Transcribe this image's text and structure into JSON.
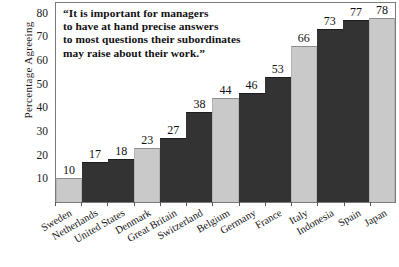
{
  "chart_data": {
    "type": "bar",
    "title": "",
    "xlabel": "",
    "ylabel": "Percentage Agreeing",
    "ylim": [
      0,
      85
    ],
    "yticks": [
      10,
      20,
      30,
      40,
      50,
      60,
      70,
      80
    ],
    "grid": false,
    "legend": null,
    "categories": [
      "Sweden",
      "Netherlands",
      "United States",
      "Denmark",
      "Great Britain",
      "Switzerland",
      "Belgium",
      "Germany",
      "France",
      "Italy",
      "Indonesia",
      "Spain",
      "Japan"
    ],
    "values": [
      10,
      17,
      18,
      23,
      27,
      38,
      44,
      46,
      53,
      66,
      73,
      77,
      78
    ],
    "bar_shades": [
      "light",
      "dark",
      "dark",
      "light",
      "dark",
      "dark",
      "light",
      "dark",
      "dark",
      "light",
      "dark",
      "dark",
      "light"
    ],
    "annotation": {
      "lines": [
        "“It is important for managers",
        "to have at hand precise answers",
        "to most questions their subordinates",
        "may raise about their work.”"
      ]
    },
    "colors": {
      "light_bar": "#c9c9c9",
      "dark_bar": "#333333",
      "frame": "#7a7a7a",
      "text": "#111111"
    }
  }
}
